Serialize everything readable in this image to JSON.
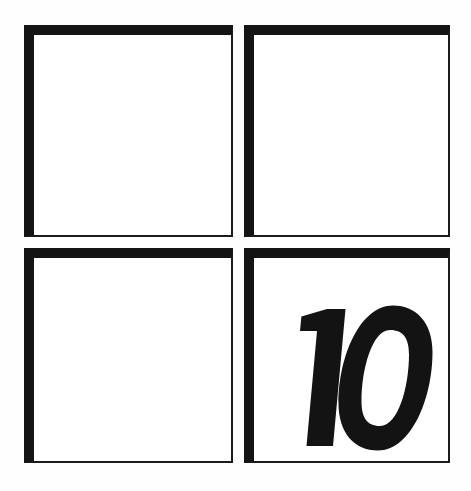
{
  "page": {
    "background_color": "#fefefe",
    "ink_color": "#141414",
    "box_fill_color": "#ffffff"
  },
  "grid": {
    "rows": 2,
    "columns": 2,
    "cells": [
      {
        "position": "top-left",
        "label": "",
        "content": "",
        "empty": true
      },
      {
        "position": "top-right",
        "label": "",
        "content": "",
        "empty": true
      },
      {
        "position": "bottom-left",
        "label": "",
        "content": "",
        "empty": true
      },
      {
        "position": "bottom-right",
        "label": "",
        "content": "10",
        "empty": false
      }
    ]
  },
  "numeral": {
    "value": "10",
    "style": "bold-oblique",
    "color": "#131313"
  }
}
